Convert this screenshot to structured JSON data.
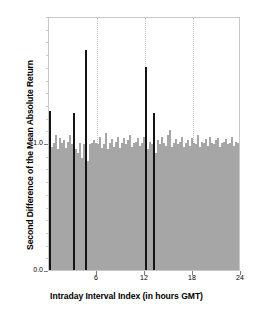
{
  "chart_data": {
    "type": "bar",
    "title": "",
    "xlabel": "Intraday Interval Index (in hours GMT)",
    "ylabel": "Second Difference of the Mean Absolute Return",
    "xlim": [
      0,
      24
    ],
    "ylim": [
      0.0,
      2.0
    ],
    "xticks": [
      6,
      12,
      18,
      24
    ],
    "xtick_labels": [
      "6",
      "12",
      "18",
      "24"
    ],
    "yticks": [
      0.0,
      1.0
    ],
    "ytick_labels": [
      "0.0",
      "1.0"
    ],
    "grid": "vertical dotted gridlines at 6, 12, 18",
    "legend": "none",
    "bar_interval_hours": 0.25,
    "colors": {
      "normal_bar": "#a6a6a6",
      "highlight_bar": "#141414",
      "frame": "#c9c9c9",
      "gridline": "#c2c2c2",
      "background": "#ffffff"
    },
    "series": [
      {
        "name": "Second difference of mean absolute return",
        "x": [
          0.125,
          0.375,
          0.625,
          0.875,
          1.125,
          1.375,
          1.625,
          1.875,
          2.125,
          2.375,
          2.625,
          2.875,
          3.125,
          3.375,
          3.625,
          3.875,
          4.125,
          4.375,
          4.625,
          4.875,
          5.125,
          5.375,
          5.625,
          5.875,
          6.125,
          6.375,
          6.625,
          6.875,
          7.125,
          7.375,
          7.625,
          7.875,
          8.125,
          8.375,
          8.625,
          8.875,
          9.125,
          9.375,
          9.625,
          9.875,
          10.125,
          10.375,
          10.625,
          10.875,
          11.125,
          11.375,
          11.625,
          11.875,
          12.125,
          12.375,
          12.625,
          12.875,
          13.125,
          13.375,
          13.625,
          13.875,
          14.125,
          14.375,
          14.625,
          14.875,
          15.125,
          15.375,
          15.625,
          15.875,
          16.125,
          16.375,
          16.625,
          16.875,
          17.125,
          17.375,
          17.625,
          17.875,
          18.125,
          18.375,
          18.625,
          18.875,
          19.125,
          19.375,
          19.625,
          19.875,
          20.125,
          20.375,
          20.625,
          20.875,
          21.125,
          21.375,
          21.625,
          21.875,
          22.125,
          22.375,
          22.625,
          22.875,
          23.125,
          23.375,
          23.625,
          23.875
        ],
        "values": [
          1.25,
          0.97,
          1.0,
          1.06,
          0.95,
          1.04,
          1.0,
          1.02,
          0.96,
          1.01,
          1.06,
          0.99,
          1.24,
          0.95,
          0.92,
          1.0,
          0.88,
          0.99,
          1.73,
          0.86,
          0.99,
          1.0,
          1.02,
          1.0,
          0.99,
          1.05,
          0.96,
          0.99,
          1.08,
          0.95,
          1.0,
          1.03,
          0.97,
          1.01,
          1.05,
          0.96,
          1.0,
          1.04,
          0.99,
          1.02,
          1.06,
          0.97,
          1.0,
          1.01,
          1.04,
          0.98,
          1.0,
          1.05,
          1.6,
          0.95,
          1.01,
          0.99,
          1.24,
          0.92,
          1.02,
          0.99,
          1.05,
          1.0,
          0.98,
          1.06,
          1.1,
          0.97,
          1.0,
          1.03,
          0.99,
          1.01,
          1.05,
          0.97,
          1.0,
          1.02,
          0.98,
          1.04,
          1.0,
          0.99,
          1.06,
          0.97,
          1.01,
          1.0,
          1.03,
          0.98,
          1.05,
          1.0,
          0.99,
          1.02,
          1.04,
          0.97,
          1.0,
          1.01,
          1.03,
          0.99,
          1.0,
          1.05,
          0.98,
          1.01,
          1.0,
          1.02
        ],
        "highlight_indices": [
          0,
          12,
          18,
          48,
          52
        ]
      }
    ]
  }
}
